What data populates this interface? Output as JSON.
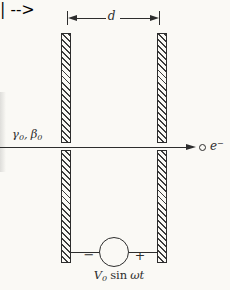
{
  "diagram": {
    "dimension_label": "d",
    "beam_label": {
      "gamma": "γ",
      "gamma_sub": "0",
      "separator": ",",
      "beta": "β",
      "beta_sub": "0"
    },
    "electron_label": {
      "base": "e",
      "sup": "−"
    },
    "source": {
      "negative_terminal": "−",
      "positive_terminal": "+",
      "caption": {
        "voltage": "V",
        "voltage_sub": "0",
        "function": "sin",
        "argument": "ωt"
      }
    },
    "colors": {
      "ink": "#2d2d2d",
      "paper": "#faf9f5"
    }
  }
}
